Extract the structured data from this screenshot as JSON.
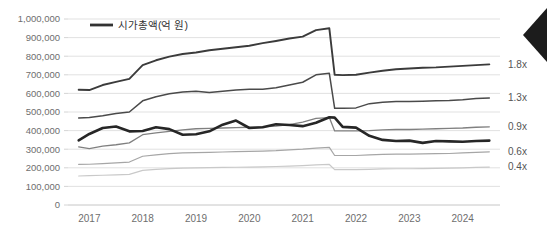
{
  "legend": {
    "label": "시가총액(억 원)",
    "marker_color": "#333333"
  },
  "annotations": {
    "corner_shape": "left-pointing-chevron"
  },
  "chart_data": {
    "type": "line",
    "title": "",
    "subtitle": "",
    "xlabel": "",
    "ylabel": "",
    "ylim": [
      0,
      1000000
    ],
    "xlim": [
      2016.6,
      2024.7
    ],
    "grid": true,
    "legend_position": "top-left",
    "y_ticks": [
      "0",
      "100,000",
      "200,000",
      "300,000",
      "400,000",
      "500,000",
      "600,000",
      "700,000",
      "800,000",
      "900,000",
      "1,000,000"
    ],
    "y_tick_values": [
      0,
      100000,
      200000,
      300000,
      400000,
      500000,
      600000,
      700000,
      800000,
      900000,
      1000000
    ],
    "x_ticks": [
      "2017",
      "2018",
      "2019",
      "2020",
      "2021",
      "2022",
      "2023",
      "2024"
    ],
    "x_tick_values": [
      2017,
      2018,
      2019,
      2020,
      2021,
      2022,
      2023,
      2024
    ],
    "x": [
      2016.8,
      2017.0,
      2017.25,
      2017.5,
      2017.75,
      2018.0,
      2018.25,
      2018.5,
      2018.75,
      2019.0,
      2019.25,
      2019.5,
      2019.75,
      2020.0,
      2020.25,
      2020.5,
      2020.75,
      2021.0,
      2021.25,
      2021.5,
      2021.6,
      2021.75,
      2022.0,
      2022.25,
      2022.5,
      2022.75,
      2023.0,
      2023.25,
      2023.5,
      2023.75,
      2024.0,
      2024.25,
      2024.5
    ],
    "series": [
      {
        "name": "1.8x",
        "ratio_label": "1.8x",
        "color": "#3b3b3b",
        "width": 1.9,
        "end_label": "1.8x",
        "values": [
          620000,
          618000,
          645000,
          662000,
          678000,
          752000,
          778000,
          798000,
          812000,
          820000,
          832000,
          840000,
          848000,
          856000,
          870000,
          882000,
          895000,
          905000,
          940000,
          950000,
          700000,
          698000,
          700000,
          712000,
          722000,
          730000,
          734000,
          738000,
          740000,
          744000,
          748000,
          752000,
          756000
        ]
      },
      {
        "name": "1.3x",
        "ratio_label": "1.3x",
        "color": "#4a4a4a",
        "width": 1.5,
        "end_label": "1.3x",
        "values": [
          468000,
          470000,
          480000,
          492000,
          500000,
          560000,
          582000,
          598000,
          608000,
          612000,
          605000,
          612000,
          618000,
          622000,
          622000,
          630000,
          645000,
          660000,
          700000,
          708000,
          520000,
          520000,
          522000,
          545000,
          552000,
          556000,
          556000,
          558000,
          560000,
          562000,
          566000,
          572000,
          575000
        ]
      },
      {
        "name": "0.9x",
        "ratio_label": "0.9x",
        "color": "#808080",
        "width": 1.3,
        "end_label": "0.9x",
        "values": [
          312000,
          303000,
          316000,
          324000,
          334000,
          378000,
          388000,
          396000,
          404000,
          410000,
          412000,
          414000,
          416000,
          418000,
          420000,
          424000,
          432000,
          446000,
          466000,
          470000,
          398000,
          398000,
          398000,
          400000,
          404000,
          406000,
          406000,
          408000,
          410000,
          412000,
          414000,
          418000,
          420000
        ]
      },
      {
        "name": "0.6x",
        "ratio_label": "0.6x",
        "color": "#a6a6a6",
        "width": 1.2,
        "end_label": "0.6x",
        "values": [
          218000,
          219000,
          222000,
          226000,
          231000,
          262000,
          270000,
          276000,
          280000,
          282000,
          283000,
          285000,
          287000,
          288000,
          290000,
          292000,
          296000,
          300000,
          306000,
          310000,
          266000,
          266000,
          266000,
          270000,
          272000,
          274000,
          274000,
          275000,
          276000,
          277000,
          280000,
          283000,
          286000
        ]
      },
      {
        "name": "0.4x",
        "ratio_label": "0.4x",
        "color": "#c9c9c9",
        "width": 1.2,
        "end_label": "0.4x",
        "values": [
          156000,
          158000,
          160000,
          162000,
          165000,
          186000,
          192000,
          196000,
          198000,
          200000,
          201000,
          202000,
          203000,
          204000,
          205000,
          207000,
          209000,
          212000,
          216000,
          218000,
          190000,
          190000,
          190000,
          192000,
          194000,
          195000,
          195000,
          196000,
          197000,
          198000,
          200000,
          202000,
          204000
        ]
      },
      {
        "name": "시가총액(억 원)",
        "ratio_label": "",
        "color": "#262626",
        "width": 2.6,
        "end_label": "",
        "values": [
          348000,
          382000,
          414000,
          422000,
          396000,
          398000,
          418000,
          408000,
          378000,
          380000,
          396000,
          432000,
          454000,
          414000,
          418000,
          434000,
          430000,
          424000,
          442000,
          472000,
          470000,
          420000,
          416000,
          372000,
          350000,
          344000,
          346000,
          334000,
          344000,
          342000,
          340000,
          344000,
          346000
        ]
      }
    ]
  }
}
